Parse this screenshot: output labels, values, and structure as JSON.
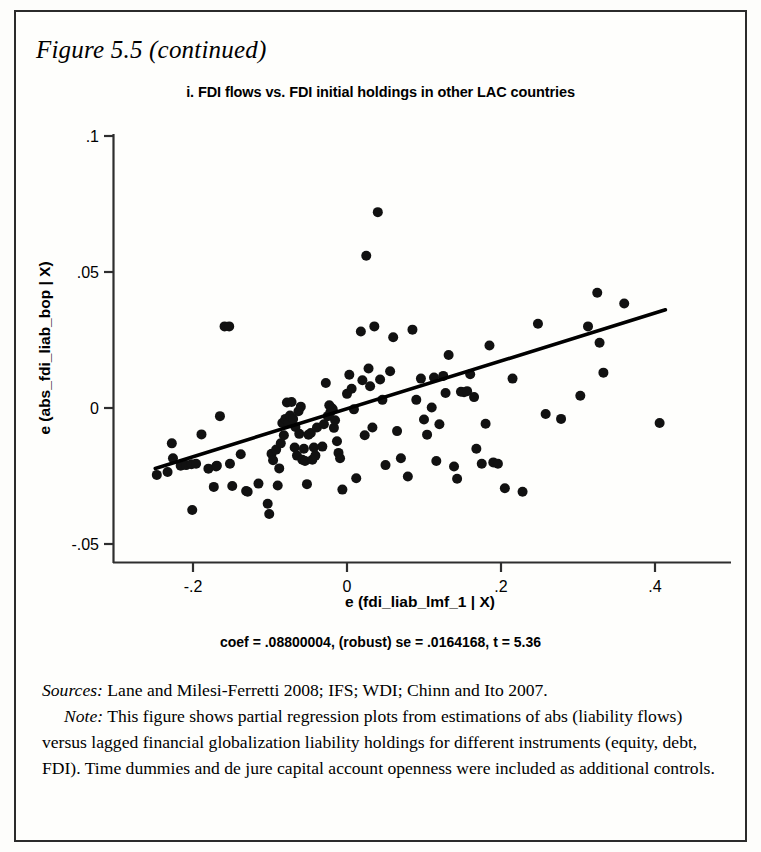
{
  "figure": {
    "caption": "Figure 5.5 (continued)"
  },
  "chart_data": {
    "type": "scatter",
    "title": "i. FDI flows vs. FDI initial holdings in other LAC countries",
    "xlabel": "e (fdi_liab_lmf_1 | X)",
    "ylabel": "e (abs_fdi_liab_bop | X)",
    "xlim": [
      -0.255,
      0.425
    ],
    "ylim": [
      -0.05,
      0.1
    ],
    "xticks": [
      -0.2,
      0,
      0.2,
      0.4
    ],
    "xticklabels": [
      "-.2",
      "0",
      ".2",
      ".4"
    ],
    "yticks": [
      -0.05,
      0,
      0.05,
      0.1
    ],
    "yticklabels": [
      "-.05",
      "0",
      ".05",
      ".1"
    ],
    "grid": false,
    "legend": null,
    "annotation": "coef = .08800004, (robust) se = .0164168, t = 5.36",
    "fit_line": {
      "slope": 0.088,
      "intercept": -0.0003,
      "x_start": -0.249,
      "x_end": 0.4135,
      "color": "#000000",
      "width": 3.6
    },
    "marker": {
      "shape": "circle",
      "size": 5.0,
      "color": "#111111"
    },
    "points": [
      [
        -0.247,
        -0.0246
      ],
      [
        -0.233,
        -0.0235
      ],
      [
        -0.2275,
        -0.013
      ],
      [
        -0.226,
        -0.0185
      ],
      [
        -0.216,
        -0.0212
      ],
      [
        -0.209,
        -0.021
      ],
      [
        -0.202,
        -0.0207
      ],
      [
        -0.201,
        -0.0375
      ],
      [
        -0.196,
        -0.0205
      ],
      [
        -0.189,
        -0.0097
      ],
      [
        -0.18,
        -0.0223
      ],
      [
        -0.173,
        -0.029
      ],
      [
        -0.17,
        -0.0215
      ],
      [
        -0.169,
        -0.0212
      ],
      [
        -0.165,
        -0.003
      ],
      [
        -0.159,
        0.03
      ],
      [
        -0.153,
        0.03
      ],
      [
        -0.152,
        -0.0205
      ],
      [
        -0.149,
        -0.0287
      ],
      [
        -0.138,
        -0.017
      ],
      [
        -0.131,
        -0.0305
      ],
      [
        -0.129,
        -0.0308
      ],
      [
        -0.115,
        -0.0278
      ],
      [
        -0.103,
        -0.0352
      ],
      [
        -0.101,
        -0.039
      ],
      [
        -0.098,
        -0.0168
      ],
      [
        -0.096,
        -0.0192
      ],
      [
        -0.092,
        -0.0153
      ],
      [
        -0.09,
        -0.0285
      ],
      [
        -0.088,
        -0.0222
      ],
      [
        -0.086,
        -0.013
      ],
      [
        -0.084,
        -0.0055
      ],
      [
        -0.082,
        -0.01
      ],
      [
        -0.08,
        -0.004
      ],
      [
        -0.078,
        0.002
      ],
      [
        -0.076,
        -0.0055
      ],
      [
        -0.074,
        -0.0028
      ],
      [
        -0.072,
        0.0022
      ],
      [
        -0.07,
        -0.004
      ],
      [
        -0.068,
        -0.0145
      ],
      [
        -0.067,
        -0.007
      ],
      [
        -0.065,
        -0.0175
      ],
      [
        -0.063,
        -0.0012
      ],
      [
        -0.062,
        -0.0095
      ],
      [
        -0.06,
        0.0005
      ],
      [
        -0.058,
        -0.019
      ],
      [
        -0.056,
        -0.015
      ],
      [
        -0.0545,
        -0.0195
      ],
      [
        -0.052,
        -0.028
      ],
      [
        -0.05,
        -0.0098
      ],
      [
        -0.047,
        -0.0092
      ],
      [
        -0.045,
        -0.019
      ],
      [
        -0.043,
        -0.0145
      ],
      [
        -0.041,
        -0.0175
      ],
      [
        -0.039,
        -0.0072
      ],
      [
        -0.032,
        -0.0142
      ],
      [
        -0.03,
        -0.006
      ],
      [
        -0.0275,
        0.0092
      ],
      [
        -0.025,
        -0.003
      ],
      [
        -0.023,
        0.001
      ],
      [
        -0.0215,
        -0.0015
      ],
      [
        -0.02,
        0.0
      ],
      [
        -0.0185,
        -0.0005
      ],
      [
        -0.017,
        -0.0073
      ],
      [
        -0.0155,
        -0.0045
      ],
      [
        -0.013,
        -0.0122
      ],
      [
        -0.011,
        -0.0165
      ],
      [
        -0.009,
        -0.0185
      ],
      [
        -0.006,
        -0.03
      ],
      [
        0.0,
        0.0052
      ],
      [
        0.003,
        0.0122
      ],
      [
        0.006,
        0.0071
      ],
      [
        0.009,
        -0.0005
      ],
      [
        0.012,
        -0.0258
      ],
      [
        0.018,
        0.0281
      ],
      [
        0.02,
        0.0102
      ],
      [
        0.023,
        -0.01
      ],
      [
        0.025,
        0.056
      ],
      [
        0.028,
        0.0145
      ],
      [
        0.03,
        0.008
      ],
      [
        0.033,
        -0.0072
      ],
      [
        0.0355,
        0.03
      ],
      [
        0.04,
        0.072
      ],
      [
        0.043,
        0.0105
      ],
      [
        0.046,
        0.003
      ],
      [
        0.05,
        -0.021
      ],
      [
        0.056,
        0.0135
      ],
      [
        0.06,
        0.026
      ],
      [
        0.065,
        -0.0085
      ],
      [
        0.07,
        -0.0185
      ],
      [
        0.079,
        -0.0252
      ],
      [
        0.085,
        0.0288
      ],
      [
        0.09,
        0.003
      ],
      [
        0.096,
        0.0108
      ],
      [
        0.1,
        -0.0042
      ],
      [
        0.104,
        -0.0098
      ],
      [
        0.11,
        0.0002
      ],
      [
        0.113,
        0.0112
      ],
      [
        0.116,
        -0.0195
      ],
      [
        0.12,
        -0.006
      ],
      [
        0.125,
        0.0118
      ],
      [
        0.128,
        0.0055
      ],
      [
        0.132,
        0.0195
      ],
      [
        0.139,
        -0.0215
      ],
      [
        0.143,
        -0.026
      ],
      [
        0.148,
        0.006
      ],
      [
        0.152,
        0.0058
      ],
      [
        0.156,
        0.0062
      ],
      [
        0.16,
        0.0124
      ],
      [
        0.165,
        0.004
      ],
      [
        0.168,
        -0.015
      ],
      [
        0.175,
        -0.0205
      ],
      [
        0.18,
        -0.0058
      ],
      [
        0.185,
        0.023
      ],
      [
        0.19,
        -0.02
      ],
      [
        0.196,
        -0.0205
      ],
      [
        0.205,
        -0.0295
      ],
      [
        0.215,
        0.0108
      ],
      [
        0.228,
        -0.0308
      ],
      [
        0.248,
        0.031
      ],
      [
        0.258,
        -0.0022
      ],
      [
        0.278,
        -0.004
      ],
      [
        0.303,
        0.0045
      ],
      [
        0.313,
        0.03
      ],
      [
        0.325,
        0.0424
      ],
      [
        0.328,
        0.024
      ],
      [
        0.333,
        0.013
      ],
      [
        0.36,
        0.0384
      ],
      [
        0.406,
        -0.0055
      ]
    ]
  },
  "notes": {
    "sources_label": "Sources:",
    "sources_text": " Lane and Milesi-Ferretti 2008; IFS; WDI; Chinn and Ito 2007.",
    "note_label": "Note:",
    "note_text": " This figure shows partial regression plots from estimations of abs (liability flows) versus lagged financial globalization liability holdings for different instruments (equity, debt, FDI). Time dummies and de jure capital account openness were included as additional controls."
  }
}
